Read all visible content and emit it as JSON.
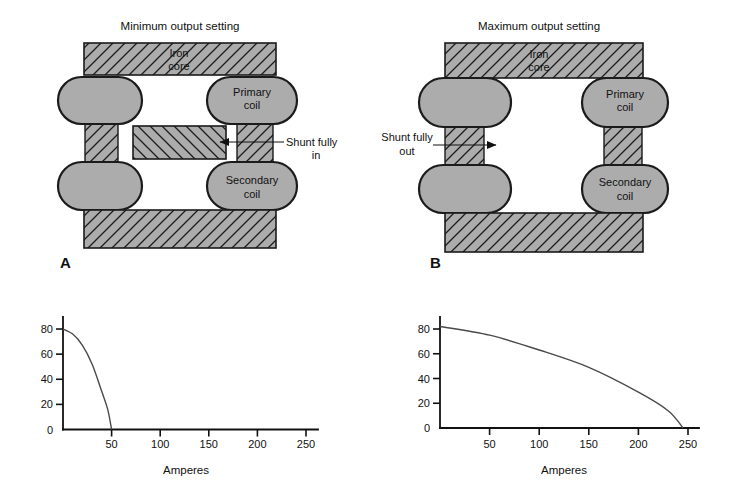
{
  "colors": {
    "background": "#ffffff",
    "metal_gray": "#acacac",
    "outline": "#1b1b1b",
    "hatch_line": "#1c1c1c",
    "axis": "#111111",
    "curve": "#4a4a4a",
    "text": "#111111"
  },
  "panels": [
    {
      "letter": "A",
      "title": "Minimum output setting",
      "iron_core_label": [
        "Iron",
        "core"
      ],
      "primary_coil_label": [
        "Primary",
        "coil"
      ],
      "secondary_coil_label": [
        "Secondary",
        "coil"
      ],
      "shunt_label": [
        "Shunt fully",
        "in"
      ]
    },
    {
      "letter": "B",
      "title": "Maximum output setting",
      "iron_core_label": [
        "Iron",
        "core"
      ],
      "primary_coil_label": [
        "Primary",
        "coil"
      ],
      "secondary_coil_label": [
        "Secondary",
        "coil"
      ],
      "shunt_label": [
        "Shunt fully",
        "out"
      ]
    }
  ],
  "chart_data": [
    {
      "type": "line",
      "panel": "A",
      "title": "",
      "xlabel": "Amperes",
      "ylabel": "",
      "x_ticks": [
        50,
        100,
        150,
        200,
        250
      ],
      "y_ticks": [
        0,
        20,
        40,
        60,
        80
      ],
      "xlim": [
        0,
        262
      ],
      "ylim": [
        0,
        90
      ],
      "grid": false,
      "legend": "none",
      "series": [
        {
          "name": "output-vs-amperes-shunt-fully-in",
          "points": [
            [
              0,
              80
            ],
            [
              10,
              76
            ],
            [
              20,
              67
            ],
            [
              30,
              52
            ],
            [
              40,
              30
            ],
            [
              46,
              16
            ],
            [
              50,
              0
            ]
          ]
        }
      ]
    },
    {
      "type": "line",
      "panel": "B",
      "title": "",
      "xlabel": "Amperes",
      "ylabel": "",
      "x_ticks": [
        50,
        100,
        150,
        200,
        250
      ],
      "y_ticks": [
        0,
        20,
        40,
        60,
        80
      ],
      "xlim": [
        0,
        262
      ],
      "ylim": [
        0,
        90
      ],
      "grid": false,
      "legend": "none",
      "series": [
        {
          "name": "output-vs-amperes-shunt-fully-out",
          "points": [
            [
              0,
              82
            ],
            [
              50,
              75
            ],
            [
              100,
              63
            ],
            [
              150,
              49
            ],
            [
              200,
              29
            ],
            [
              230,
              14
            ],
            [
              245,
              0
            ]
          ]
        }
      ]
    }
  ]
}
